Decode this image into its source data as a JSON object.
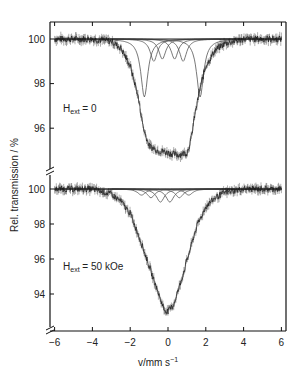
{
  "chart_data": [
    {
      "type": "line",
      "panel": "top",
      "annotation": {
        "main": "H",
        "sub": "ext",
        "rest": " = 0"
      },
      "xlabel": "v/mm s⁻¹",
      "ylabel": "Rel. transmission / %",
      "xlim": [
        -6,
        6
      ],
      "ylim": [
        94.3,
        100.6
      ],
      "yticks": [
        96,
        98,
        100
      ],
      "xticks": [
        -6,
        -4,
        -2,
        0,
        2,
        4,
        6
      ],
      "grid": false,
      "series": [
        {
          "name": "data",
          "style": "noisy-points",
          "x": [
            -6,
            -5,
            -4,
            -3,
            -2.5,
            -2,
            -1.6,
            -1.3,
            -1,
            -0.5,
            0,
            0.5,
            1,
            1.2,
            1.4,
            1.7,
            2,
            2.5,
            3,
            4,
            5,
            6
          ],
          "y": [
            100,
            100,
            100,
            99.9,
            99.6,
            98.8,
            97.5,
            96.0,
            95.2,
            95.0,
            94.9,
            94.8,
            94.9,
            95.4,
            96.5,
            97.8,
            98.8,
            99.5,
            99.8,
            100,
            100,
            100
          ]
        },
        {
          "name": "fit-component-1",
          "center": -1.25,
          "depth": 2.6,
          "width": 0.45
        },
        {
          "name": "fit-component-2",
          "center": -0.75,
          "depth": 1.0,
          "width": 0.45
        },
        {
          "name": "fit-component-3",
          "center": -0.3,
          "depth": 0.9,
          "width": 0.45
        },
        {
          "name": "fit-component-4",
          "center": 0.35,
          "depth": 0.9,
          "width": 0.45
        },
        {
          "name": "fit-component-5",
          "center": 0.8,
          "depth": 1.0,
          "width": 0.45
        },
        {
          "name": "fit-component-6",
          "center": 1.7,
          "depth": 2.6,
          "width": 0.45
        }
      ]
    },
    {
      "type": "line",
      "panel": "bottom",
      "annotation": {
        "main": "H",
        "sub": "ext",
        "rest": " = 50 kOe"
      },
      "xlabel": "v/mm s⁻¹",
      "ylabel": "Rel. transmission / %",
      "xlim": [
        -6,
        6
      ],
      "ylim": [
        92.1,
        100.6
      ],
      "yticks": [
        94,
        96,
        98,
        100
      ],
      "xticks": [
        -6,
        -4,
        -2,
        0,
        2,
        4,
        6
      ],
      "grid": false,
      "series": [
        {
          "name": "data",
          "style": "noisy-points",
          "x": [
            -6,
            -5,
            -4,
            -3,
            -2.5,
            -2,
            -1.5,
            -1,
            -0.5,
            -0.2,
            0,
            0.3,
            0.6,
            1,
            1.5,
            2,
            2.5,
            3,
            4,
            5,
            6
          ],
          "y": [
            100,
            100,
            100,
            99.7,
            99.3,
            98.6,
            97.2,
            95.6,
            94.0,
            93.1,
            93.0,
            93.4,
            94.4,
            95.9,
            97.8,
            99.0,
            99.5,
            99.8,
            100,
            100,
            100
          ]
        },
        {
          "name": "fit-component-1",
          "center": -1.4,
          "depth": 0.35,
          "width": 0.5
        },
        {
          "name": "fit-component-2",
          "center": -0.9,
          "depth": 0.5,
          "width": 0.5
        },
        {
          "name": "fit-component-3",
          "center": -0.4,
          "depth": 0.75,
          "width": 0.5
        },
        {
          "name": "fit-component-4",
          "center": 0.1,
          "depth": 0.75,
          "width": 0.5
        },
        {
          "name": "fit-component-5",
          "center": 0.6,
          "depth": 0.5,
          "width": 0.5
        },
        {
          "name": "fit-component-6",
          "center": 1.1,
          "depth": 0.35,
          "width": 0.5
        }
      ]
    }
  ],
  "labels": {
    "ylabel": "Rel. transmission / %",
    "xlabel_main": "v/mm s",
    "xlabel_sup": "−1",
    "top_annot_main": "H",
    "top_annot_sub": "ext",
    "top_annot_rest": " = 0",
    "bottom_annot_main": "H",
    "bottom_annot_sub": "ext",
    "bottom_annot_rest": " = 50 kOe",
    "xticks": [
      "−6",
      "−4",
      "−2",
      "0",
      "2",
      "4",
      "6"
    ],
    "top_yticks": [
      "100",
      "98",
      "96"
    ],
    "bottom_yticks": [
      "100",
      "98",
      "96",
      "94"
    ]
  },
  "colors": {
    "data": "#1a1a1a",
    "fit": "#555555",
    "axis": "#111111"
  }
}
